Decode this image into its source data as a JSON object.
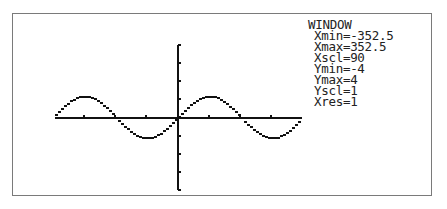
{
  "window_settings": {
    "title": "WINDOW",
    "rows": [
      {
        "label": "Xmin",
        "text": "Xmin=-352.5"
      },
      {
        "label": "Xmax",
        "text": "Xmax=352.5"
      },
      {
        "label": "Xscl",
        "text": "Xscl=90"
      },
      {
        "label": "Ymin",
        "text": "Ymin=-4"
      },
      {
        "label": "Ymax",
        "text": "Ymax=4"
      },
      {
        "label": "Yscl",
        "text": "Yscl=1"
      },
      {
        "label": "Xres",
        "text": "Xres=1"
      }
    ]
  },
  "graph": {
    "function": "sin(x)",
    "angle_mode": "degree",
    "xmin": -352.5,
    "xmax": 352.5,
    "xscl": 90,
    "ymin": -4,
    "ymax": 4,
    "yscl": 1,
    "colors": {
      "axis": "#111111",
      "curve": "#111111",
      "frame": "#7a7a7a"
    }
  }
}
